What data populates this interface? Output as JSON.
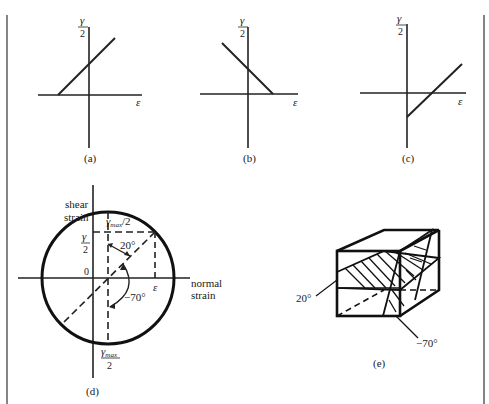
{
  "panels": {
    "a": {
      "caption": "(a)",
      "y_label_num": "γ",
      "y_label_den": "2",
      "x_label": "ε",
      "line": "positive slope, crosses vertical axis above origin, meets ε-axis left of origin"
    },
    "b": {
      "caption": "(b)",
      "y_label_num": "γ",
      "y_label_den": "2",
      "x_label": "ε",
      "line": "negative slope, crosses vertical axis above origin, meets ε-axis right of origin"
    },
    "c": {
      "caption": "(c)",
      "y_label_num": "γ",
      "y_label_den": "2",
      "x_label": "ε",
      "line": "positive slope, starts below origin on vertical axis, crosses ε-axis right of origin"
    },
    "d": {
      "caption": "(d)",
      "y_axis_label_1": "shear",
      "y_axis_label_2": "strain",
      "x_axis_label_1": "normal",
      "x_axis_label_2": "strain",
      "top_label": "γmax/2",
      "top_label_main": "γ",
      "top_label_sub": "max",
      "top_label_tail": "/2",
      "gamma_half_num": "γ",
      "gamma_half_den": "2",
      "origin_label": "0",
      "epsilon_label": "ε",
      "angle_1": "20°",
      "angle_2": "−70°",
      "bottom_label_main": "γ",
      "bottom_label_sub": "max",
      "bottom_label_den": "2"
    },
    "e": {
      "caption": "(e)",
      "angle_1": "20°",
      "angle_2": "−70°"
    }
  }
}
